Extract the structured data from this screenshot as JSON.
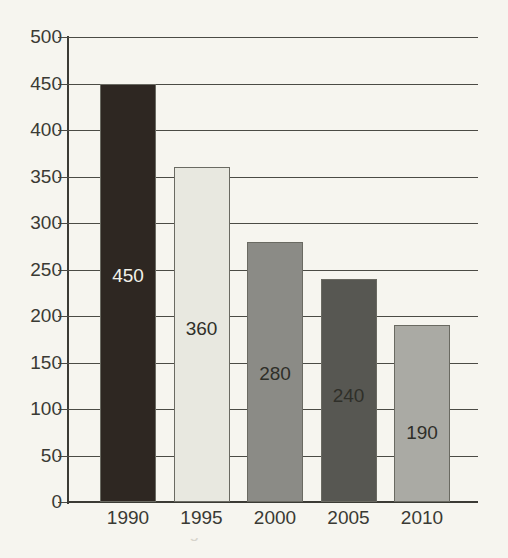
{
  "background_color": "#f6f5ef",
  "axis_color": "#3b3b35",
  "grid_color": "#4b4b45",
  "chart_data": {
    "type": "bar",
    "title": "",
    "subtitle": "",
    "xlabel": "",
    "ylabel": "",
    "categories": [
      "1990",
      "1995",
      "2000",
      "2005",
      "2010"
    ],
    "values": [
      450,
      360,
      280,
      240,
      190
    ],
    "data_labels": [
      "450",
      "360",
      "280",
      "240",
      "190"
    ],
    "ylim": [
      0,
      500
    ],
    "y_ticks": [
      0,
      50,
      100,
      150,
      200,
      250,
      300,
      350,
      400,
      450,
      500
    ],
    "y_tick_labels": [
      "0",
      "50",
      "100",
      "150",
      "200",
      "250",
      "300",
      "350",
      "400",
      "450",
      "500"
    ],
    "grid": "horizontal",
    "legend": "none",
    "bar_colors": [
      "#2e2722",
      "#e8e8e0",
      "#8b8b86",
      "#575752",
      "#aaaaa4"
    ],
    "bar_label_colors": [
      "#f2f1ea",
      "#2f2f29",
      "#2f2f29",
      "#2f2f29",
      "#2f2f29"
    ],
    "bars": [
      {
        "category": "1990",
        "value": 450,
        "label": "450",
        "fill": "#2e2722",
        "label_color": "#f2f1ea"
      },
      {
        "category": "1995",
        "value": 360,
        "label": "360",
        "fill": "#e8e8e0",
        "label_color": "#2f2f29"
      },
      {
        "category": "2000",
        "value": 280,
        "label": "280",
        "fill": "#8b8b86",
        "label_color": "#2f2f29"
      },
      {
        "category": "2005",
        "value": 240,
        "label": "240",
        "fill": "#575752",
        "label_color": "#2f2f29"
      },
      {
        "category": "2010",
        "value": 190,
        "label": "190",
        "fill": "#aaaaa4",
        "label_color": "#2f2f29"
      }
    ]
  },
  "caption_fragment": "illustration of declining values over time"
}
